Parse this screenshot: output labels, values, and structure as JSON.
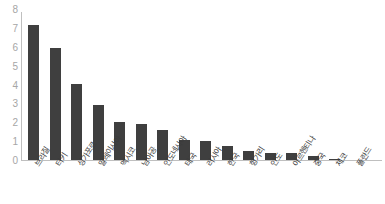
{
  "chart_data": {
    "type": "bar",
    "title": "",
    "subtitle": "",
    "xlabel": "",
    "ylabel": "",
    "grid": false,
    "legend": "none",
    "bar_color": "#3f3f3f",
    "axis_color": "#bfbfbf",
    "tick_label_color": "#a6a6a6",
    "ylim": [
      0,
      8
    ],
    "yticks": [
      "0",
      "1",
      "2",
      "3",
      "4",
      "5",
      "6",
      "7",
      "8"
    ],
    "ytick_values": [
      0,
      1,
      2,
      3,
      4,
      5,
      6,
      7,
      8
    ],
    "categories": [
      "브라질",
      "터키",
      "싱가포르",
      "말레이시아",
      "멕시코",
      "남아공",
      "인도네시아",
      "태국",
      "러시아",
      "한국",
      "헝가리",
      "인도",
      "아르헨티나",
      "중국",
      "체코",
      "폴란드"
    ],
    "values": [
      7.2,
      6.0,
      4.1,
      2.95,
      2.05,
      1.95,
      1.65,
      1.1,
      1.08,
      0.8,
      0.55,
      0.4,
      0.4,
      0.27,
      0.13,
      0.08
    ],
    "series": [
      {
        "name": "",
        "values": [
          7.2,
          6.0,
          4.1,
          2.95,
          2.05,
          1.95,
          1.65,
          1.1,
          1.08,
          0.8,
          0.55,
          0.4,
          0.4,
          0.27,
          0.13,
          0.08
        ]
      }
    ]
  }
}
